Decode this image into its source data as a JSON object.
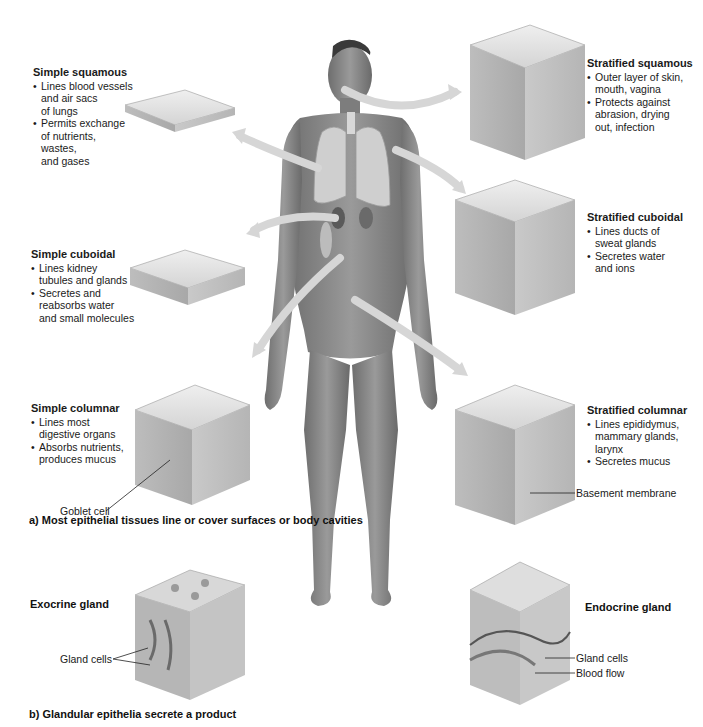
{
  "figure": {
    "part_a_caption": "a) Most epithelial tissues line or cover surfaces or body cavities",
    "part_b_caption": "b) Glandular epithelia secrete a product",
    "colors": {
      "arrow": "#d6d6d6",
      "skin": "#8a8a8a",
      "tissue_light": "#e4e4e4",
      "tissue_mid": "#b8b8b8",
      "tissue_dark": "#7a7a7a",
      "text": "#1a1a1a"
    }
  },
  "tissues": {
    "simple_squamous": {
      "title": "Simple squamous",
      "bullets": [
        "Lines blood vessels\nand air sacs\nof lungs",
        "Permits exchange\nof nutrients, wastes,\nand gases"
      ]
    },
    "simple_cuboidal": {
      "title": "Simple cuboidal",
      "bullets": [
        "Lines kidney\ntubules and glands",
        "Secretes and\nreabsorbs water\nand small molecules"
      ]
    },
    "simple_columnar": {
      "title": "Simple columnar",
      "bullets": [
        "Lines most\ndigestive organs",
        "Absorbs nutrients,\nproduces mucus"
      ],
      "callout": "Goblet  cell"
    },
    "stratified_squamous": {
      "title": "Stratified squamous",
      "bullets": [
        "Outer layer of skin,\nmouth, vagina",
        "Protects against\nabrasion, drying\nout, infection"
      ]
    },
    "stratified_cuboidal": {
      "title": "Stratified cuboidal",
      "bullets": [
        "Lines ducts of\nsweat glands",
        "Secretes water\nand ions"
      ]
    },
    "stratified_columnar": {
      "title": "Stratified columnar",
      "bullets": [
        "Lines epididymus,\nmammary glands,\nlarynx",
        "Secretes mucus"
      ],
      "callout": "Basement membrane"
    }
  },
  "glands": {
    "exocrine": {
      "title": "Exocrine gland",
      "callout": "Gland cells"
    },
    "endocrine": {
      "title": "Endocrine gland",
      "callouts": [
        "Gland cells",
        "Blood flow"
      ]
    }
  }
}
